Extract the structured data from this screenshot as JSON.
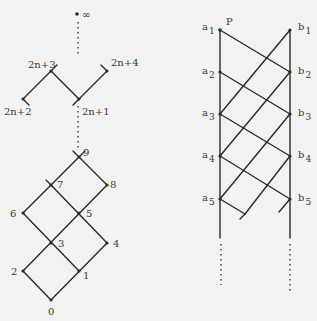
{
  "left_lattice": {
    "top_label": "∞",
    "labels": {
      "n2n4": "2n+4",
      "n2n3": "2n+3",
      "n2n2": "2n+2",
      "n2n1": "2n+1",
      "n9": "9",
      "n8": "8",
      "n7": "7",
      "n6": "6",
      "n5": "5",
      "n4": "4",
      "n3": "3",
      "n2": "2",
      "n1": "1",
      "n0": "0"
    }
  },
  "right_lattice": {
    "top_point_label": "P",
    "a": [
      "a",
      "a",
      "a",
      "a",
      "a"
    ],
    "b": [
      "b",
      "b",
      "b",
      "b",
      "b"
    ],
    "subscripts": [
      "1",
      "2",
      "3",
      "4",
      "5"
    ]
  }
}
